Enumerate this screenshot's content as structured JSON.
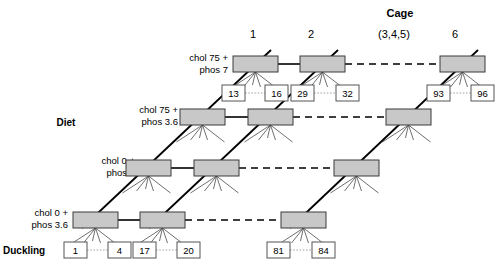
{
  "header": {
    "cage_title": "Cage",
    "columns": [
      {
        "label": "1",
        "x": 253
      },
      {
        "label": "2",
        "x": 311
      },
      {
        "label": "(3,4,5)",
        "x": 394
      },
      {
        "label": "6",
        "x": 455
      }
    ],
    "cage_title_x": 400,
    "cage_title_y": 17
  },
  "axis_labels": {
    "diet": "Diet",
    "diet_x": 42,
    "diet_y": 126,
    "duckling": "Duckling",
    "duckling_x": 3,
    "duckling_y": 254
  },
  "diets": [
    {
      "line1": "chol 75 +",
      "line2": "phos 7",
      "x": 228,
      "y1": 61,
      "y2": 73
    },
    {
      "line1": "chol 75 +",
      "line2": "phos 3.6",
      "x": 178,
      "y1": 113,
      "y2": 125
    },
    {
      "line1": "chol 0 +",
      "line2": "phos 7",
      "x": 135,
      "y1": 164,
      "y2": 176
    },
    {
      "line1": "chol 0 +",
      "line2": "phos 3.6",
      "x": 68,
      "y1": 216,
      "y2": 228
    }
  ],
  "cage_boxes": [
    {
      "row": 0,
      "col": 0,
      "x": 233,
      "y": 56,
      "w": 45,
      "h": 16
    },
    {
      "row": 0,
      "col": 1,
      "x": 300,
      "y": 56,
      "w": 45,
      "h": 16
    },
    {
      "row": 0,
      "col": 3,
      "x": 440,
      "y": 56,
      "w": 45,
      "h": 16
    },
    {
      "row": 1,
      "col": 0,
      "x": 180,
      "y": 109,
      "w": 45,
      "h": 16
    },
    {
      "row": 1,
      "col": 1,
      "x": 248,
      "y": 109,
      "w": 45,
      "h": 16
    },
    {
      "row": 1,
      "col": 3,
      "x": 386,
      "y": 109,
      "w": 45,
      "h": 16
    },
    {
      "row": 2,
      "col": 0,
      "x": 126,
      "y": 160,
      "w": 45,
      "h": 16
    },
    {
      "row": 2,
      "col": 1,
      "x": 194,
      "y": 160,
      "w": 45,
      "h": 16
    },
    {
      "row": 2,
      "col": 3,
      "x": 334,
      "y": 160,
      "w": 45,
      "h": 16
    },
    {
      "row": 3,
      "col": 0,
      "x": 73,
      "y": 212,
      "w": 45,
      "h": 16
    },
    {
      "row": 3,
      "col": 1,
      "x": 140,
      "y": 212,
      "w": 45,
      "h": 16
    },
    {
      "row": 3,
      "col": 3,
      "x": 281,
      "y": 212,
      "w": 45,
      "h": 16
    }
  ],
  "duckling_boxes": [
    {
      "label": "13",
      "x": 222,
      "y": 85,
      "w": 23,
      "h": 16
    },
    {
      "label": "16",
      "x": 265,
      "y": 85,
      "w": 23,
      "h": 16
    },
    {
      "label": "29",
      "x": 291,
      "y": 85,
      "w": 23,
      "h": 16
    },
    {
      "label": "32",
      "x": 336,
      "y": 85,
      "w": 23,
      "h": 16
    },
    {
      "label": "93",
      "x": 427,
      "y": 85,
      "w": 23,
      "h": 16
    },
    {
      "label": "96",
      "x": 471,
      "y": 85,
      "w": 23,
      "h": 16
    },
    {
      "label": "1",
      "x": 64,
      "y": 242,
      "w": 23,
      "h": 16
    },
    {
      "label": "4",
      "x": 108,
      "y": 242,
      "w": 23,
      "h": 16
    },
    {
      "label": "17",
      "x": 133,
      "y": 242,
      "w": 23,
      "h": 16
    },
    {
      "label": "20",
      "x": 177,
      "y": 242,
      "w": 23,
      "h": 16
    },
    {
      "label": "81",
      "x": 267,
      "y": 242,
      "w": 23,
      "h": 16
    },
    {
      "label": "84",
      "x": 312,
      "y": 242,
      "w": 23,
      "h": 16
    }
  ],
  "colors": {
    "cage_fill": "#c8c8c8",
    "cage_stroke": "#3a3a3a",
    "duck_fill": "#ffffff",
    "duck_stroke": "#555555",
    "line": "#000000",
    "background": "#ffffff"
  }
}
